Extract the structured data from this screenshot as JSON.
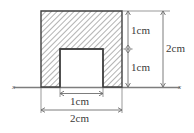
{
  "figure": {
    "type": "geometry-diagram",
    "background_color": "#ffffff",
    "outline_color": "#3f3f3f",
    "hatch_color": "#9a9a9a",
    "fill_color": "#ffffff",
    "dimension_color": "#6e6e6e",
    "text_color": "#3a3a3a",
    "axis": {
      "left_label": "x",
      "right_label": "x",
      "color": "#7d7d7d"
    },
    "shape": {
      "outer_square_side": "2cm",
      "inner_notch_side": "1cm"
    },
    "dimensions": {
      "right_upper": "1cm",
      "right_lower": "1cm",
      "right_total": "2cm",
      "bottom_inner": "1cm",
      "bottom_outer": "2cm"
    }
  }
}
